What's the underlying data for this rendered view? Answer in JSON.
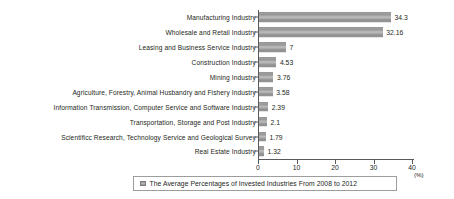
{
  "chart_data": {
    "type": "bar",
    "orientation": "horizontal",
    "title": "",
    "xlabel": "(%)",
    "ylabel": "",
    "xlim": [
      0,
      40
    ],
    "xticks": [
      0,
      10,
      20,
      30,
      40
    ],
    "grid": false,
    "legend_position": "bottom",
    "categories": [
      "Manufacturing Industry",
      "Wholesale and Retail Industry",
      "Leasing and Business Service Industry",
      "Construction Industry",
      "Mining Industry",
      "Agriculture, Forestry, Animal Husbandry and Fishery Industry",
      "Information Transmission, Computer Service and Software Industry",
      "Transportation, Storage and Post Industry",
      "Scientificc Research, Technology Service and Geological Survey",
      "Real Estate Industry"
    ],
    "values": [
      34.3,
      32.16,
      7,
      4.53,
      3.76,
      3.58,
      2.39,
      2.1,
      1.79,
      1.32
    ],
    "value_labels": [
      "34.3",
      "32.16",
      "7",
      "4.53",
      "3.76",
      "3.58",
      "2.39",
      "2.1",
      "1.79",
      "1.32"
    ],
    "series": [
      {
        "name": "The Average Percentages of Invested Industries From 2008 to 2012",
        "values": [
          34.3,
          32.16,
          7,
          4.53,
          3.76,
          3.58,
          2.39,
          2.1,
          1.79,
          1.32
        ],
        "color": "#a0a0a0"
      }
    ],
    "legend": [
      {
        "label": "The Average Percentages of Invested Industries From 2008 to 2012",
        "color": "#a0a0a0"
      }
    ],
    "axis_unit_label": "(%)",
    "colors": {
      "bar_fill": "#a0a0a0",
      "bar_edge": "#7d7d7d",
      "axis": "#58595b",
      "text": "#231f20",
      "background": "#ffffff",
      "legend_border": "#9d9d9d"
    }
  }
}
